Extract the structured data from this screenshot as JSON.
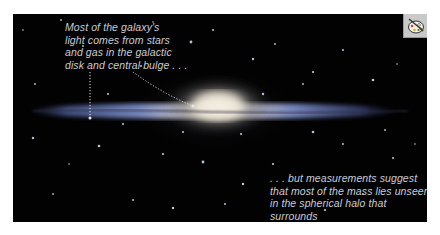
{
  "figure": {
    "colors": {
      "background": "#020203",
      "caption_text": "#c9ccd6",
      "disk_blue": "#6f84c9",
      "bulge_core": "#f3ead6",
      "leader_line": "#e8e8ee"
    }
  },
  "annotations": {
    "disk_and_bulge": "Most of the galaxy's\nlight comes from stars\nand gas in the galactic\ndisk and central bulge . . .",
    "halo": ". . . but measurements suggest\nthat most of the mass lies unseen\nin the spherical halo that surrounds\nthe entire disk."
  },
  "toolbar": {
    "art_icon": "palette-brush-icon"
  }
}
